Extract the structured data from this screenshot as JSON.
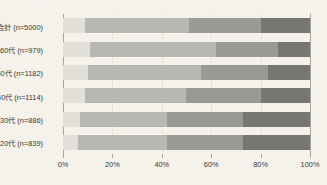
{
  "top_cropped_text": "· · · · · · · · · ·",
  "chart_data": {
    "type": "bar",
    "subtype": "stacked-horizontal-100",
    "title": "",
    "xlabel": "",
    "ylabel": "",
    "xlim": [
      0,
      100
    ],
    "grid": true,
    "legend": "none",
    "axis_unit": "%",
    "categories": [
      "合計 (n=5000)",
      "60代 (n=979)",
      "50代 (n=1182)",
      "40代 (n=1114)",
      "30代 (n=886)",
      "20代 (n=839)"
    ],
    "tick_labels": [
      "0%",
      "20%",
      "40%",
      "60%",
      "80%",
      "100%"
    ],
    "tick_values": [
      0,
      20,
      40,
      60,
      80,
      100
    ],
    "series": [
      {
        "name": "segment-1",
        "color": "#e2e0d8",
        "values": [
          9,
          11,
          10,
          9,
          7,
          6
        ]
      },
      {
        "name": "segment-2",
        "color": "#b8b8b2",
        "values": [
          42,
          51,
          46,
          41,
          35,
          36
        ]
      },
      {
        "name": "segment-3",
        "color": "#9a9a95",
        "values": [
          29,
          25,
          27,
          30,
          31,
          31
        ]
      },
      {
        "name": "segment-4",
        "color": "#767672",
        "values": [
          20,
          13,
          17,
          20,
          27,
          27
        ]
      }
    ]
  },
  "colors": {
    "background": "#f4f2ea",
    "axis": "#a9a69c",
    "gridline": "#e6e3da",
    "text": "#3b3a36"
  }
}
